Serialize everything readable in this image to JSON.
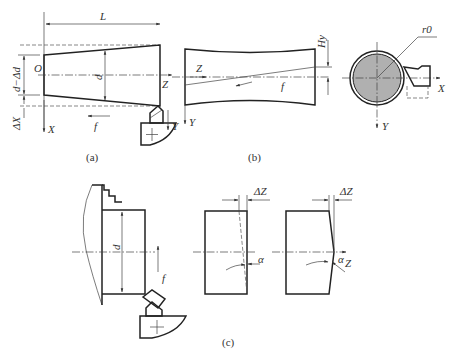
{
  "figure": {
    "panel_a": {
      "caption": "(a)",
      "labels": {
        "length": "L",
        "origin": "O",
        "diameter": "d",
        "small_diameter": "d−Δd",
        "delta_x": "ΔX",
        "axis_x": "X",
        "axis_z": "Z",
        "axis_y": "Y",
        "feed": "f"
      }
    },
    "panel_b": {
      "caption": "(b)",
      "labels": {
        "axis_z": "Z",
        "feed": "f",
        "height_error": "Hy",
        "radius": "r0",
        "axis_x": "X",
        "axis_y": "Y"
      }
    },
    "panel_c": {
      "caption": "(c)",
      "labels": {
        "diameter": "d",
        "feed": "f",
        "delta_z_1": "ΔZ",
        "delta_z_2": "ΔZ",
        "alpha_1": "α",
        "alpha_2": "α",
        "axis_z": "Z"
      }
    },
    "colors": {
      "line": "#222222",
      "workpiece_fill": "#b0b0b0"
    }
  }
}
